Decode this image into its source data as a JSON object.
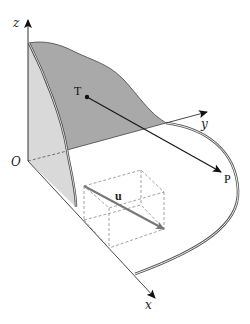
{
  "diagram": {
    "type": "3d-coordinate-figure",
    "colors": {
      "background": "#ffffff",
      "axis": "#333333",
      "back_surface": "#a9a9a9",
      "side_surface": "#d9d9d9",
      "vector_u": "#777777",
      "dashed_box": "#8a8a8a",
      "line_TP": "#1a1a1a"
    },
    "axes": {
      "x": {
        "label": "x"
      },
      "y": {
        "label": "y"
      },
      "z": {
        "label": "z"
      },
      "origin": {
        "label": "O"
      }
    },
    "points": {
      "T": {
        "label": "T"
      },
      "P": {
        "label": "P"
      }
    },
    "vectors": {
      "u": {
        "label": "u"
      }
    }
  }
}
